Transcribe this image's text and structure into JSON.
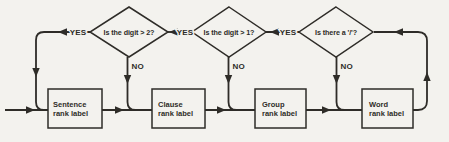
{
  "figure": {
    "type": "flowchart",
    "colors": {
      "ink": "#2e2c28",
      "paper": "#f3f2ee"
    }
  },
  "flowchart": {
    "decisions": [
      {
        "id": "digit-gt-2",
        "label": "Is the digit > 2?",
        "yes": "YES",
        "no": "NO"
      },
      {
        "id": "digit-gt-1",
        "label": "Is the digit > 1?",
        "yes": "YES",
        "no": "NO"
      },
      {
        "id": "has-slash",
        "label": "Is there a '/'?",
        "yes": "YES",
        "no": "NO"
      }
    ],
    "processes": [
      {
        "id": "sentence",
        "line1": "Sentence",
        "line2": "rank label"
      },
      {
        "id": "clause",
        "line1": "Clause",
        "line2": "rank label"
      },
      {
        "id": "group",
        "line1": "Group",
        "line2": "rank label"
      },
      {
        "id": "word",
        "line1": "Word",
        "line2": "rank label"
      }
    ]
  }
}
